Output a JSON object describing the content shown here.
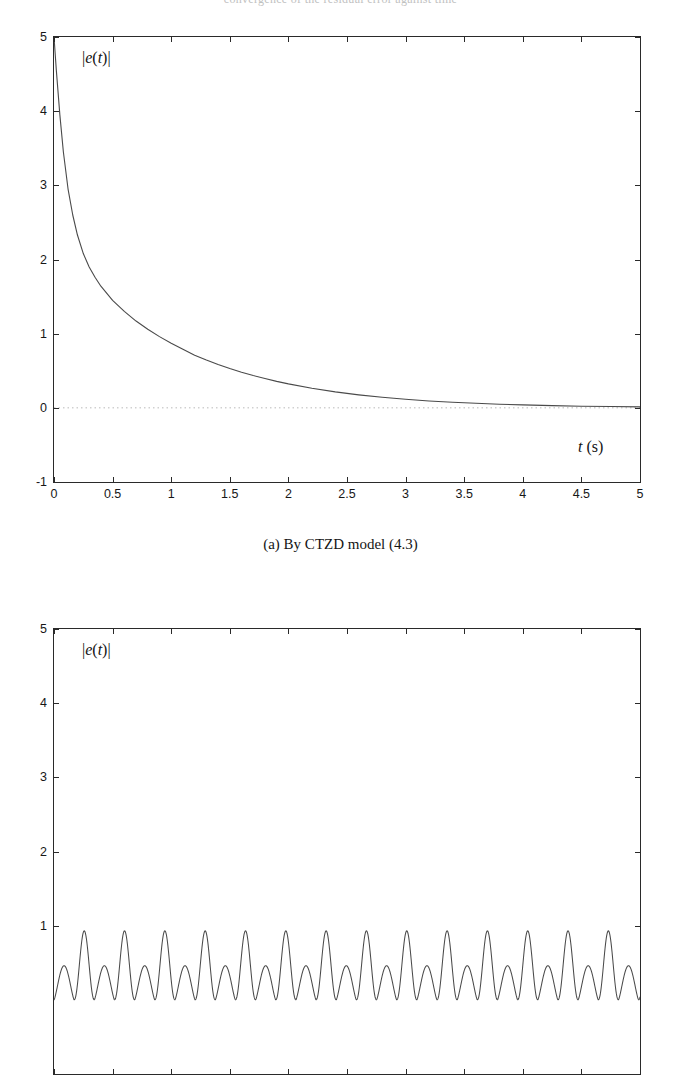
{
  "page": {
    "running_head_partial": "convergence of the residual error against time"
  },
  "figures": [
    {
      "id": "fig-a",
      "caption": "(a) By CTZD model (4.3)",
      "y_axis_note": "|e(t)|",
      "x_axis_note": "t (s)",
      "chart_data": {
        "type": "line",
        "title": "",
        "xlabel": "t (s)",
        "ylabel": "|e(t)|",
        "xlim": [
          0,
          5
        ],
        "ylim": [
          -1,
          5
        ],
        "xticks": [
          0,
          0.5,
          1,
          1.5,
          2,
          2.5,
          3,
          3.5,
          4,
          4.5,
          5
        ],
        "xticklabels": [
          "0",
          "0.5",
          "1",
          "1.5",
          "2",
          "2.5",
          "3",
          "3.5",
          "4",
          "4.5",
          "5"
        ],
        "yticks": [
          -1,
          0,
          1,
          2,
          3,
          4,
          5
        ],
        "yticklabels": [
          "-1",
          "0",
          "1",
          "2",
          "3",
          "4",
          "5"
        ],
        "grid": false,
        "legend": "none",
        "series": [
          {
            "name": "|e(t)| CTZD",
            "comment": "monotonic decay from 5 to ~0, steep initial drop then long tail",
            "x": [
              0,
              0.02,
              0.05,
              0.08,
              0.12,
              0.16,
              0.2,
              0.25,
              0.3,
              0.35,
              0.4,
              0.5,
              0.6,
              0.7,
              0.8,
              0.9,
              1.0,
              1.1,
              1.2,
              1.3,
              1.4,
              1.5,
              1.6,
              1.7,
              1.8,
              1.9,
              2.0,
              2.2,
              2.4,
              2.6,
              2.8,
              3.0,
              3.2,
              3.4,
              3.6,
              3.8,
              4.0,
              4.25,
              4.5,
              4.75,
              5.0
            ],
            "y": [
              5.0,
              4.55,
              3.95,
              3.45,
              2.95,
              2.6,
              2.33,
              2.08,
              1.9,
              1.76,
              1.64,
              1.45,
              1.3,
              1.17,
              1.06,
              0.96,
              0.87,
              0.79,
              0.71,
              0.645,
              0.585,
              0.53,
              0.48,
              0.435,
              0.395,
              0.357,
              0.323,
              0.265,
              0.215,
              0.175,
              0.142,
              0.115,
              0.093,
              0.075,
              0.061,
              0.049,
              0.04,
              0.03,
              0.022,
              0.017,
              0.013
            ]
          }
        ],
        "reference_line": {
          "y": 0,
          "style": "dotted",
          "color": "#b9b9b9"
        }
      }
    },
    {
      "id": "fig-b",
      "caption": "",
      "y_axis_note": "|e(t)|",
      "x_axis_note": "",
      "chart_data": {
        "type": "line",
        "title": "",
        "xlabel": "",
        "ylabel": "|e(t)|",
        "xlim": [
          0,
          5
        ],
        "ylim": [
          -1,
          5
        ],
        "xticks": [
          0,
          0.5,
          1,
          1.5,
          2,
          2.5,
          3,
          3.5,
          4,
          4.5,
          5
        ],
        "xticklabels": [],
        "yticks": [
          1,
          2,
          3,
          4,
          5
        ],
        "yticklabels": [
          "1",
          "2",
          "3",
          "4",
          "5"
        ],
        "grid": false,
        "legend": "none",
        "clipped_at_page_bottom": true,
        "series": [
          {
            "name": "|e(t)| oscillatory",
            "comment": "persistent non-vanishing oscillation; alternating small (~0.45) and tall (~0.93) peaks, period ~0.17 s",
            "peak_high": 0.93,
            "peak_low": 0.46,
            "trough": 0.0,
            "period": 0.172
          }
        ]
      }
    }
  ]
}
